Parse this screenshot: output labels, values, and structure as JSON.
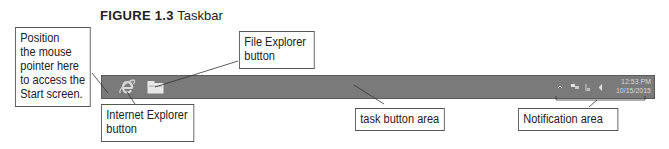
{
  "figure": {
    "number": "FIGURE 1.3",
    "caption": "Taskbar"
  },
  "callouts": {
    "start_screen": "Position the mouse pointer here to access the Start screen.",
    "start_screen_lines": [
      "Position",
      "the mouse",
      "pointer here",
      "to access the",
      "Start screen."
    ],
    "internet_explorer": [
      "Internet Explorer",
      "button"
    ],
    "file_explorer": [
      "File Explorer",
      "button"
    ],
    "task_button_area": "task button area",
    "notification_area": "Notification area"
  },
  "taskbar": {
    "pinned": [
      {
        "name": "Internet Explorer",
        "icon": "internet-explorer-icon"
      },
      {
        "name": "File Explorer",
        "icon": "file-explorer-icon"
      }
    ],
    "tray_icons": [
      "show-hidden-icons-arrow",
      "network-icon",
      "action-center-flag-icon",
      "volume-icon"
    ],
    "clock": {
      "time": "12:53 PM",
      "date": "10/15/2015"
    },
    "colors": {
      "bar": "#7a7a7a",
      "border": "#5a5a5a"
    }
  }
}
